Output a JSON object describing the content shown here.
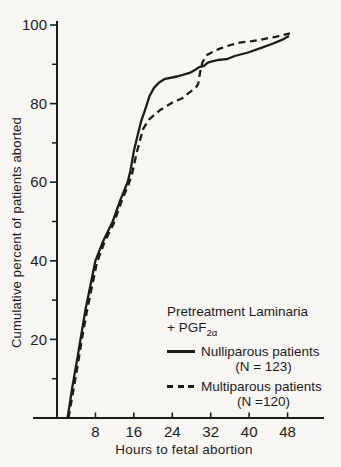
{
  "colors": {
    "ink": "#1c1c1c",
    "background": "#f8f6f3"
  },
  "legend": {
    "title_line1": "Pretreatment Laminaria",
    "title_line2_prefix": "+ PGF",
    "title_line2_sub": "2α",
    "items": [
      {
        "label": "Nulliparous patients",
        "n": "(N = 123)",
        "style": "solid"
      },
      {
        "label": "Multiparous patients",
        "n": "(N =120)",
        "style": "dashed"
      }
    ]
  },
  "chart_data": {
    "type": "line",
    "title": "",
    "xlabel": "Hours to fetal abortion",
    "ylabel": "Cumulative percent of patients aborted",
    "xlim": [
      0,
      56
    ],
    "ylim": [
      0,
      100
    ],
    "x_ticks": [
      8,
      16,
      24,
      32,
      40,
      48
    ],
    "y_ticks_major": [
      20,
      40,
      60,
      80,
      100
    ],
    "y_ticks_minor": [
      10,
      30,
      50,
      70,
      90
    ],
    "grid": false,
    "legend_position": "lower right",
    "series": [
      {
        "name": "Nulliparous patients",
        "n": 123,
        "style": "solid",
        "points": [
          [
            2.2,
            0
          ],
          [
            3.2,
            8
          ],
          [
            4.2,
            15
          ],
          [
            4.9,
            20
          ],
          [
            6.0,
            28
          ],
          [
            7.0,
            34
          ],
          [
            8.0,
            40
          ],
          [
            9.6,
            45
          ],
          [
            11.6,
            50
          ],
          [
            13.2,
            55.5
          ],
          [
            14.7,
            60
          ],
          [
            15.3,
            63
          ],
          [
            16.0,
            68
          ],
          [
            16.8,
            72
          ],
          [
            17.5,
            75.5
          ],
          [
            18.3,
            78.3
          ],
          [
            19.3,
            82
          ],
          [
            20.2,
            84
          ],
          [
            21.2,
            85.3
          ],
          [
            22.5,
            86.3
          ],
          [
            25.0,
            86.9
          ],
          [
            27.6,
            87.8
          ],
          [
            28.8,
            88.6
          ],
          [
            29.6,
            89.3
          ],
          [
            30.6,
            89.6
          ],
          [
            31.4,
            90.4
          ],
          [
            32.5,
            90.8
          ],
          [
            33.5,
            91.1
          ],
          [
            35.3,
            91.3
          ],
          [
            37.0,
            92.1
          ],
          [
            39.8,
            93.0
          ],
          [
            42.8,
            94.3
          ],
          [
            45.0,
            95.3
          ],
          [
            46.8,
            96.2
          ],
          [
            48.3,
            97.2
          ]
        ]
      },
      {
        "name": "Multiparous patients",
        "n": 120,
        "style": "dashed",
        "points": [
          [
            2.4,
            0
          ],
          [
            3.4,
            7
          ],
          [
            4.4,
            14
          ],
          [
            5.1,
            19.5
          ],
          [
            6.2,
            27
          ],
          [
            7.2,
            33
          ],
          [
            8.3,
            39.5
          ],
          [
            9.8,
            44.5
          ],
          [
            11.8,
            49.5
          ],
          [
            13.4,
            55
          ],
          [
            14.9,
            59.5
          ],
          [
            15.7,
            62.5
          ],
          [
            16.6,
            67.5
          ],
          [
            17.9,
            73.5
          ],
          [
            19.2,
            76
          ],
          [
            21.4,
            78.3
          ],
          [
            24.2,
            80.4
          ],
          [
            26.0,
            81.3
          ],
          [
            27.5,
            82.8
          ],
          [
            28.9,
            84.0
          ],
          [
            29.4,
            85
          ],
          [
            29.8,
            88
          ],
          [
            30.3,
            90.5
          ],
          [
            31.1,
            92.3
          ],
          [
            31.9,
            92.8
          ],
          [
            33.0,
            93.5
          ],
          [
            33.9,
            94.0
          ],
          [
            36.1,
            94.9
          ],
          [
            38.0,
            95.5
          ],
          [
            40.6,
            95.9
          ],
          [
            43.0,
            96.4
          ],
          [
            45.5,
            97.0
          ],
          [
            48.5,
            97.9
          ]
        ]
      }
    ]
  }
}
